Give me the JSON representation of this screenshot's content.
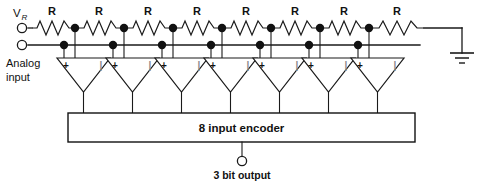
{
  "labels": {
    "vref": "V",
    "vref_sub": "R",
    "analog_line1": "Analog",
    "analog_line2": "input",
    "encoder": "8 input encoder",
    "output": "3 bit output",
    "resistor": "R",
    "plus": "+",
    "minus": "|"
  },
  "colors": {
    "wire": "#1a1a1a",
    "node": "#111111",
    "background": "#ffffff",
    "text": "#111111"
  },
  "circuit": {
    "resistor_count": 8,
    "resistor_labels": [
      "R",
      "R",
      "R",
      "R",
      "R",
      "R",
      "R",
      "R"
    ],
    "comparator_count": 7,
    "tap_node_count": 7,
    "analog_node_count": 7,
    "ground_symbol": "earth-ground",
    "terminals": [
      {
        "name": "vref-terminal",
        "label": "V_R"
      },
      {
        "name": "analog-input-terminal",
        "label": "Analog input"
      },
      {
        "name": "output-terminal",
        "label": "3 bit output"
      }
    ]
  },
  "geometry": {
    "ref_rail_y": 28,
    "analog_rail_y": 45,
    "tri_top_y": 58,
    "tri_tip_y": 92,
    "box_top_y": 113,
    "box_bottom_y": 142,
    "box_left_x": 68,
    "box_right_x": 415,
    "tap_x": [
      75,
      124,
      173,
      222,
      271,
      320,
      369
    ],
    "comp_center_x": [
      86,
      135,
      184,
      233,
      282,
      331,
      380
    ],
    "analog_dot_x": [
      64,
      113,
      162,
      211,
      260,
      309,
      358
    ],
    "resistor_span_x": [
      [
        30,
        75
      ],
      [
        75,
        124
      ],
      [
        124,
        173
      ],
      [
        173,
        222
      ],
      [
        222,
        271
      ],
      [
        271,
        320
      ],
      [
        320,
        369
      ],
      [
        369,
        440
      ]
    ],
    "ground_x": 462,
    "output_x": 242
  }
}
